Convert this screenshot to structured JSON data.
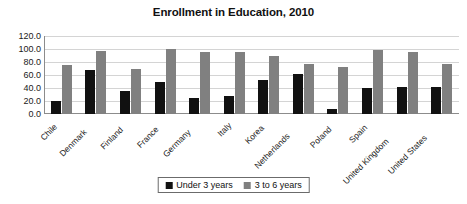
{
  "chart_data": {
    "type": "bar",
    "title": "Enrollment in Education, 2010",
    "xlabel": "",
    "ylabel": "",
    "ylim": [
      0,
      120
    ],
    "yticks": [
      "0.0",
      "20.0",
      "40.0",
      "60.0",
      "80.0",
      "100.0",
      "120.0"
    ],
    "ytick_values": [
      0,
      20,
      40,
      60,
      80,
      100,
      120
    ],
    "grid": true,
    "legend_position": "bottom",
    "categories": [
      "Chile",
      "Denmark",
      "Finland",
      "France",
      "Germany",
      "Italy",
      "Korea",
      "Netherlands",
      "Poland",
      "Spain",
      "United Kingdom",
      "United States"
    ],
    "series": [
      {
        "name": "Under 3 years",
        "color": "#111111",
        "values": [
          20,
          67,
          35,
          50,
          25,
          27,
          53,
          62,
          8,
          40,
          42,
          42
        ]
      },
      {
        "name": "3 to 6 years",
        "color": "#808080",
        "values": [
          75,
          97,
          70,
          100,
          96,
          96,
          90,
          77,
          72,
          98,
          95,
          77
        ]
      }
    ]
  },
  "colors": {
    "series_under_3": "#111111",
    "series_3_to_6": "#808080",
    "gridline": "#d4d4d4",
    "axis": "#8c8c8c",
    "text": "#1a1a1a",
    "background": "#ffffff"
  }
}
